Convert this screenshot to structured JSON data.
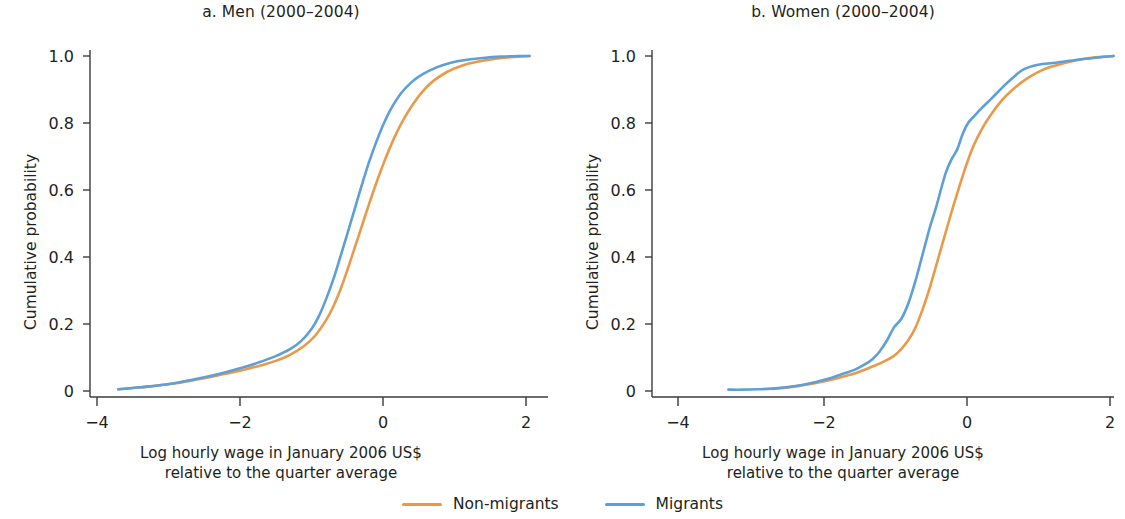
{
  "figure": {
    "background": "#ffffff",
    "colors": {
      "non_migrants": "#e89a4a",
      "migrants": "#5d9fd6",
      "axis": "#3b3b3b",
      "text": "#231f20"
    }
  },
  "legend": {
    "position": "bottom-center",
    "entries": [
      {
        "label": "Non-migrants",
        "color": "#e89a4a",
        "icon": "line-swatch"
      },
      {
        "label": "Migrants",
        "color": "#5d9fd6",
        "icon": "line-swatch"
      }
    ]
  },
  "panels": [
    {
      "id": "men",
      "title": "a. Men (2000–2004)",
      "ylabel": "Cumulative probability",
      "xlabel_line1": "Log hourly wage in January 2006 US$",
      "xlabel_line2": "relative to the quarter average",
      "xticks": [
        "−4",
        "−2",
        "0",
        "2"
      ],
      "yticks": [
        "1.0",
        "0.8",
        "0.6",
        "0.4",
        "0.2",
        "0"
      ]
    },
    {
      "id": "women",
      "title": "b. Women (2000–2004)",
      "ylabel": "Cumulative probability",
      "xlabel_line1": "Log hourly wage in January 2006 US$",
      "xlabel_line2": "relative to the quarter average",
      "xticks": [
        "−4",
        "−2",
        "0",
        "2"
      ],
      "yticks": [
        "1.0",
        "0.8",
        "0.6",
        "0.4",
        "0.2",
        "0"
      ]
    }
  ],
  "chart_data": {
    "type": "line",
    "xlabel": "Log hourly wage in January 2006 US$ relative to the quarter average",
    "ylabel": "Cumulative probability",
    "xlim": [
      -4.4,
      2.2
    ],
    "ylim": [
      0,
      1.04
    ],
    "xticks": [
      -4,
      -2,
      0,
      2
    ],
    "yticks": [
      0,
      0.2,
      0.4,
      0.6,
      0.8,
      1.0
    ],
    "grid": false,
    "legend_position": "bottom-center",
    "panels": [
      {
        "name": "a. Men (2000–2004)",
        "series": [
          {
            "name": "Non-migrants",
            "color": "#e89a4a",
            "x": [
              -3.7,
              -3.5,
              -3.3,
              -3.1,
              -2.9,
              -2.7,
              -2.5,
              -2.3,
              -2.1,
              -1.9,
              -1.7,
              -1.5,
              -1.3,
              -1.1,
              -0.95,
              -0.8,
              -0.7,
              -0.6,
              -0.5,
              -0.4,
              -0.3,
              -0.2,
              -0.1,
              0.0,
              0.1,
              0.2,
              0.3,
              0.4,
              0.55,
              0.7,
              0.9,
              1.1,
              1.3,
              1.55,
              1.8,
              2.05
            ],
            "y": [
              0.005,
              0.009,
              0.013,
              0.018,
              0.023,
              0.03,
              0.038,
              0.047,
              0.056,
              0.066,
              0.077,
              0.09,
              0.108,
              0.135,
              0.165,
              0.21,
              0.25,
              0.3,
              0.36,
              0.425,
              0.49,
              0.555,
              0.617,
              0.675,
              0.728,
              0.775,
              0.815,
              0.85,
              0.893,
              0.925,
              0.953,
              0.971,
              0.982,
              0.991,
              0.997,
              1.0
            ]
          },
          {
            "name": "Migrants",
            "color": "#5d9fd6",
            "x": [
              -3.7,
              -3.5,
              -3.3,
              -3.1,
              -2.9,
              -2.7,
              -2.5,
              -2.3,
              -2.1,
              -1.9,
              -1.7,
              -1.5,
              -1.3,
              -1.15,
              -1.0,
              -0.9,
              -0.8,
              -0.7,
              -0.6,
              -0.5,
              -0.4,
              -0.3,
              -0.2,
              -0.1,
              0.0,
              0.1,
              0.25,
              0.4,
              0.55,
              0.75,
              0.95,
              1.15,
              1.4,
              1.65,
              1.9,
              2.05
            ],
            "y": [
              0.005,
              0.009,
              0.013,
              0.018,
              0.024,
              0.032,
              0.041,
              0.051,
              0.062,
              0.074,
              0.088,
              0.104,
              0.125,
              0.148,
              0.185,
              0.222,
              0.272,
              0.33,
              0.398,
              0.468,
              0.54,
              0.612,
              0.68,
              0.74,
              0.793,
              0.838,
              0.888,
              0.922,
              0.945,
              0.966,
              0.98,
              0.988,
              0.994,
              0.998,
              1.0,
              1.0
            ]
          }
        ]
      },
      {
        "name": "b. Women (2000–2004)",
        "series": [
          {
            "name": "Non-migrants",
            "color": "#e89a4a",
            "x": [
              -2.7,
              -2.5,
              -2.3,
              -2.1,
              -1.9,
              -1.7,
              -1.5,
              -1.3,
              -1.15,
              -1.0,
              -0.9,
              -0.8,
              -0.7,
              -0.6,
              -0.5,
              -0.4,
              -0.3,
              -0.2,
              -0.1,
              0.0,
              0.1,
              0.22,
              0.35,
              0.5,
              0.65,
              0.85,
              1.05,
              1.25,
              1.5,
              1.75,
              2.05
            ],
            "y": [
              0.006,
              0.01,
              0.016,
              0.023,
              0.032,
              0.043,
              0.056,
              0.073,
              0.087,
              0.105,
              0.125,
              0.152,
              0.19,
              0.245,
              0.31,
              0.385,
              0.46,
              0.535,
              0.605,
              0.672,
              0.73,
              0.782,
              0.826,
              0.868,
              0.9,
              0.933,
              0.957,
              0.972,
              0.986,
              0.995,
              1.0
            ]
          },
          {
            "name": "Migrants",
            "color": "#5d9fd6",
            "x": [
              -3.3,
              -3.1,
              -2.9,
              -2.7,
              -2.5,
              -2.3,
              -2.1,
              -1.9,
              -1.7,
              -1.55,
              -1.4,
              -1.3,
              -1.2,
              -1.1,
              -1.0,
              -0.9,
              -0.8,
              -0.7,
              -0.6,
              -0.5,
              -0.42,
              -0.35,
              -0.28,
              -0.2,
              -0.12,
              -0.05,
              0.03,
              0.12,
              0.22,
              0.35,
              0.5,
              0.65,
              0.8,
              1.0,
              1.25,
              1.55,
              1.85,
              2.05
            ],
            "y": [
              0.004,
              0.004,
              0.005,
              0.007,
              0.011,
              0.017,
              0.026,
              0.037,
              0.052,
              0.063,
              0.08,
              0.095,
              0.118,
              0.15,
              0.19,
              0.215,
              0.262,
              0.33,
              0.41,
              0.49,
              0.545,
              0.6,
              0.652,
              0.692,
              0.722,
              0.765,
              0.8,
              0.822,
              0.845,
              0.872,
              0.905,
              0.935,
              0.96,
              0.974,
              0.98,
              0.989,
              0.996,
              1.0
            ]
          }
        ]
      }
    ]
  }
}
